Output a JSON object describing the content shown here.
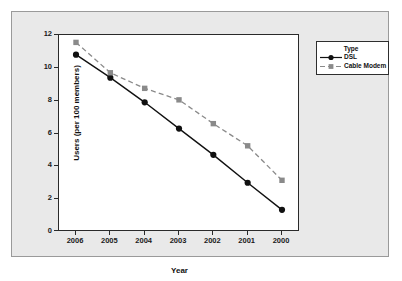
{
  "chart_data": {
    "type": "line",
    "title": "",
    "xlabel": "Year",
    "ylabel": "Users (per 100 members)",
    "categories": [
      "2006",
      "2005",
      "2004",
      "2003",
      "2002",
      "2001",
      "2000"
    ],
    "x": [
      "2006",
      "2005",
      "2004",
      "2003",
      "2002",
      "2001",
      "2000"
    ],
    "ylim": [
      0,
      12
    ],
    "yticks": [
      "0",
      "2",
      "4",
      "6",
      "8",
      "10",
      "12"
    ],
    "grid": false,
    "legend_position": "right",
    "legend_title": "Type",
    "series": [
      {
        "name": "DSL",
        "values": [
          10.8,
          9.4,
          7.9,
          6.3,
          4.7,
          3.0,
          1.35
        ],
        "color": "#111111",
        "linestyle": "solid",
        "marker": "circle"
      },
      {
        "name": "Cable Modem",
        "values": [
          11.55,
          9.7,
          8.75,
          8.05,
          6.6,
          5.25,
          3.15
        ],
        "color": "#8a8a8a",
        "linestyle": "dashed",
        "marker": "square"
      }
    ]
  },
  "colors": {
    "canvas_background": "#e9e9e9",
    "plot_background": "#ffffff",
    "axis": "#2a2a2a",
    "dsl": "#111111",
    "cable_modem": "#8a8a8a"
  }
}
